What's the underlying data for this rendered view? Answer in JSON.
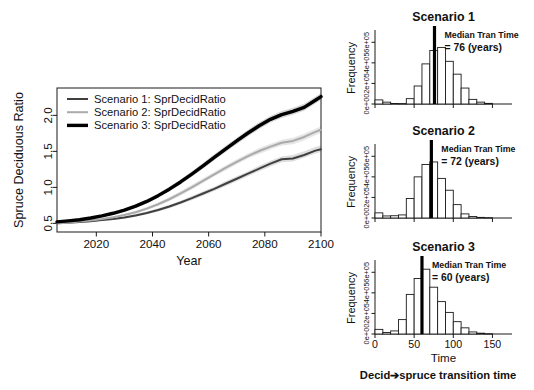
{
  "figure": {
    "width": 534,
    "height": 390,
    "background": "#ffffff",
    "axis_color": "#1a1a1a",
    "bar_stroke": "#1a1a1a",
    "median_line_color": "#000000"
  },
  "chart_data": [
    {
      "id": "timeseries",
      "type": "line",
      "title": "",
      "xlabel": "Year",
      "ylabel": "Spruce Deciduous Ratio",
      "xlim": [
        2006,
        2100
      ],
      "ylim": [
        0.38,
        2.38
      ],
      "xticks": [
        2020,
        2040,
        2060,
        2080,
        2100
      ],
      "xticklabels": [
        "2020",
        "2040",
        "2060",
        "2080",
        "2100"
      ],
      "yticks": [
        0.5,
        1.0,
        1.5,
        2.0
      ],
      "yticklabels": [
        "0.5",
        "1.0",
        "1.5",
        "2.0"
      ],
      "grid": false,
      "legend_position": "top-left",
      "x": [
        2006,
        2010,
        2014,
        2018,
        2022,
        2026,
        2030,
        2034,
        2038,
        2042,
        2046,
        2050,
        2054,
        2058,
        2062,
        2066,
        2070,
        2074,
        2078,
        2082,
        2086,
        2090,
        2094,
        2098,
        2100
      ],
      "series": [
        {
          "name": "Scenario 1: SprDecidRatio",
          "color": "#3f3f3f",
          "width": 2.0,
          "band_color": "#c9c9c9",
          "values": [
            0.5,
            0.51,
            0.52,
            0.53,
            0.545,
            0.56,
            0.58,
            0.61,
            0.645,
            0.685,
            0.735,
            0.79,
            0.85,
            0.915,
            0.98,
            1.05,
            1.12,
            1.19,
            1.26,
            1.33,
            1.39,
            1.4,
            1.45,
            1.51,
            1.53
          ],
          "band_lower": [
            0.49,
            0.5,
            0.51,
            0.52,
            0.535,
            0.55,
            0.565,
            0.595,
            0.625,
            0.665,
            0.71,
            0.765,
            0.82,
            0.885,
            0.95,
            1.015,
            1.085,
            1.155,
            1.225,
            1.29,
            1.35,
            1.36,
            1.41,
            1.47,
            1.49
          ],
          "band_upper": [
            0.51,
            0.52,
            0.53,
            0.545,
            0.56,
            0.575,
            0.595,
            0.63,
            0.665,
            0.71,
            0.76,
            0.815,
            0.88,
            0.945,
            1.01,
            1.085,
            1.155,
            1.225,
            1.3,
            1.37,
            1.43,
            1.45,
            1.5,
            1.56,
            1.58
          ]
        },
        {
          "name": "Scenario 2: SprDecidRatio",
          "color": "#aaaaaa",
          "width": 2.0,
          "band_color": "#d6d6d6",
          "values": [
            0.5,
            0.51,
            0.525,
            0.54,
            0.56,
            0.585,
            0.615,
            0.655,
            0.705,
            0.765,
            0.835,
            0.915,
            1.0,
            1.09,
            1.18,
            1.27,
            1.355,
            1.435,
            1.505,
            1.565,
            1.62,
            1.645,
            1.7,
            1.77,
            1.8
          ],
          "band_lower": [
            0.49,
            0.5,
            0.515,
            0.53,
            0.55,
            0.57,
            0.6,
            0.635,
            0.685,
            0.74,
            0.81,
            0.885,
            0.97,
            1.06,
            1.15,
            1.235,
            1.32,
            1.4,
            1.465,
            1.525,
            1.58,
            1.6,
            1.655,
            1.725,
            1.755
          ],
          "band_upper": [
            0.51,
            0.52,
            0.535,
            0.555,
            0.575,
            0.6,
            0.635,
            0.675,
            0.73,
            0.79,
            0.865,
            0.945,
            1.035,
            1.125,
            1.215,
            1.305,
            1.39,
            1.47,
            1.545,
            1.605,
            1.66,
            1.69,
            1.745,
            1.815,
            1.845
          ]
        },
        {
          "name": "Scenario 3: SprDecidRatio",
          "color": "#000000",
          "width": 3.4,
          "band_color": "#bdbdbd",
          "values": [
            0.52,
            0.535,
            0.55,
            0.575,
            0.605,
            0.64,
            0.685,
            0.74,
            0.805,
            0.885,
            0.975,
            1.075,
            1.185,
            1.3,
            1.415,
            1.53,
            1.645,
            1.755,
            1.855,
            1.945,
            2.01,
            2.055,
            2.11,
            2.21,
            2.26
          ],
          "band_lower": [
            0.51,
            0.525,
            0.54,
            0.56,
            0.59,
            0.625,
            0.665,
            0.715,
            0.78,
            0.855,
            0.945,
            1.04,
            1.15,
            1.26,
            1.375,
            1.49,
            1.6,
            1.71,
            1.81,
            1.9,
            1.965,
            2.01,
            2.065,
            2.165,
            2.215
          ],
          "band_upper": [
            0.535,
            0.55,
            0.565,
            0.59,
            0.62,
            0.66,
            0.705,
            0.765,
            0.835,
            0.915,
            1.01,
            1.11,
            1.22,
            1.34,
            1.46,
            1.575,
            1.69,
            1.8,
            1.905,
            1.99,
            2.06,
            2.105,
            2.16,
            2.26,
            2.31
          ]
        }
      ]
    },
    {
      "id": "hist-scenario-1",
      "type": "bar",
      "title": "Scenario 1",
      "xlabel": "",
      "ylabel": "Frequency",
      "xlim": [
        0,
        175
      ],
      "ylim": [
        0,
        700000
      ],
      "xticks": [
        0,
        50,
        100,
        150
      ],
      "xticklabels": [
        "",
        "",
        "",
        ""
      ],
      "yticks": [
        0,
        200000,
        400000,
        600000
      ],
      "yticklabels": [
        "0e+00",
        "2e+05",
        "4e+05",
        "6e+05"
      ],
      "bin_width": 10,
      "bin_starts": [
        0,
        10,
        20,
        30,
        40,
        50,
        60,
        70,
        80,
        90,
        100,
        110,
        120,
        130,
        140
      ],
      "values": [
        40000,
        18000,
        5000,
        4000,
        52000,
        175000,
        390000,
        520000,
        550000,
        415000,
        290000,
        155000,
        45000,
        18000,
        6000
      ],
      "annotation": {
        "line1": "Median Tran Time",
        "line2": "= 76 (years)"
      },
      "median": 76
    },
    {
      "id": "hist-scenario-2",
      "type": "bar",
      "title": "Scenario 2",
      "xlabel": "",
      "ylabel": "Frequency",
      "xlim": [
        0,
        175
      ],
      "ylim": [
        0,
        700000
      ],
      "xticks": [
        0,
        50,
        100,
        150
      ],
      "xticklabels": [
        "",
        "",
        "",
        ""
      ],
      "yticks": [
        0,
        200000,
        400000,
        600000
      ],
      "yticklabels": [
        "0e+00",
        "2e+05",
        "4e+05",
        "6e+05"
      ],
      "bin_width": 10,
      "bin_starts": [
        0,
        10,
        20,
        30,
        40,
        50,
        60,
        70,
        80,
        90,
        100,
        110,
        120,
        130,
        140
      ],
      "values": [
        50000,
        20000,
        22000,
        30000,
        190000,
        400000,
        520000,
        545000,
        385000,
        270000,
        130000,
        40000,
        14000,
        6000,
        3000
      ],
      "annotation": {
        "line1": "Median Tran Time",
        "line2": "= 72 (years)"
      },
      "median": 72
    },
    {
      "id": "hist-scenario-3",
      "type": "bar",
      "title": "Scenario 3",
      "xlabel": "Time",
      "ylabel": "Frequency",
      "xlim": [
        0,
        175
      ],
      "ylim": [
        0,
        700000
      ],
      "xticks": [
        0,
        50,
        100,
        150
      ],
      "xticklabels": [
        "0",
        "50",
        "100",
        "150"
      ],
      "yticks": [
        0,
        200000,
        400000,
        600000
      ],
      "yticklabels": [
        "0e+00",
        "2e+05",
        "4e+05",
        "6e+05"
      ],
      "bin_width": 10,
      "bin_starts": [
        0,
        10,
        20,
        30,
        40,
        50,
        60,
        70,
        80,
        90,
        100,
        110,
        120,
        130,
        140
      ],
      "values": [
        45000,
        15000,
        30000,
        140000,
        385000,
        540000,
        630000,
        455000,
        315000,
        210000,
        120000,
        60000,
        20000,
        8000,
        3000
      ],
      "annotation": {
        "line1": "Median Tran Time",
        "line2": "= 60 (years)"
      },
      "median": 60
    }
  ],
  "caption": {
    "bottom_label": "Decid➔spruce transition time"
  }
}
